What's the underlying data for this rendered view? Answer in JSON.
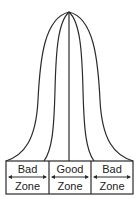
{
  "diagram": {
    "type": "bell-curve-zones",
    "stroke_color": "#2a2a2a",
    "zones": [
      {
        "top": "Bad",
        "bottom": "Zone"
      },
      {
        "top": "Good",
        "bottom": "Zone"
      },
      {
        "top": "Bad",
        "bottom": "Zone"
      }
    ]
  }
}
